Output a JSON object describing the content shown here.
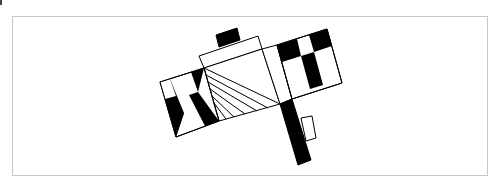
{
  "diagram": {
    "colors": {
      "stroke": "#000000",
      "fill_dark": "#000000",
      "fill_light": "#ffffff",
      "frame": "#c8c8c8"
    },
    "shapes": {
      "top_block": [
        [
          216,
          35
        ],
        [
          237,
          28
        ],
        [
          240,
          40
        ],
        [
          219,
          47
        ]
      ],
      "top_rect": [
        [
          199,
          56
        ],
        [
          258,
          36
        ],
        [
          262,
          49
        ],
        [
          204,
          68
        ]
      ],
      "center_square": [
        [
          204,
          68
        ],
        [
          262,
          49
        ],
        [
          280,
          104
        ],
        [
          219,
          121
        ]
      ],
      "strip": [
        [
          262,
          49
        ],
        [
          277,
          45
        ],
        [
          292,
          99
        ],
        [
          280,
          104
        ]
      ],
      "left_flag": [
        [
          160,
          82
        ],
        [
          204,
          68
        ],
        [
          219,
          121
        ],
        [
          176,
          137
        ]
      ],
      "right_flag": [
        [
          277,
          45
        ],
        [
          327,
          29
        ],
        [
          342,
          83
        ],
        [
          292,
          99
        ]
      ],
      "black_bar": [
        [
          280,
          104
        ],
        [
          292,
          99
        ],
        [
          311,
          160
        ],
        [
          298,
          165
        ]
      ],
      "small_rect": [
        [
          301,
          118
        ],
        [
          312,
          116
        ],
        [
          316,
          138
        ],
        [
          306,
          141
        ]
      ]
    }
  }
}
